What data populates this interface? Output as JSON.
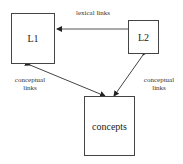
{
  "diagram": {
    "nodes": [
      {
        "id": "L1",
        "label": "L1"
      },
      {
        "id": "L2",
        "label": "L2"
      },
      {
        "id": "concepts",
        "label": "concepts"
      }
    ],
    "edges": [
      {
        "from": "L2",
        "to": "L1",
        "label": "lexical links",
        "direction": "forward"
      },
      {
        "from": "L1",
        "to": "concepts",
        "label": "conceptual links",
        "direction": "both"
      },
      {
        "from": "L2",
        "to": "concepts",
        "label": "conceptual links",
        "direction": "both"
      }
    ],
    "labels": {
      "lexical": "lexical links",
      "conceptual_left_1": "conceptual",
      "conceptual_left_2": "links",
      "conceptual_right_1": "conceptual",
      "conceptual_right_2": "links"
    }
  }
}
